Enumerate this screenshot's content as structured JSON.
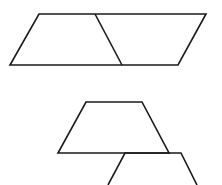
{
  "diagram": {
    "stroke_color": "#1a1a1a",
    "background": "#ffffff",
    "shapes": [
      {
        "name": "parallelogram",
        "points": [
          [
            39,
            14
          ],
          [
            206,
            14
          ],
          [
            178,
            65
          ],
          [
            10,
            65
          ]
        ],
        "closed": true
      },
      {
        "name": "parallelogram-divider",
        "points": [
          [
            95,
            14
          ],
          [
            122,
            65
          ]
        ],
        "closed": false
      },
      {
        "name": "trapezoid",
        "points": [
          [
            86,
            102
          ],
          [
            142,
            102
          ],
          [
            169,
            153
          ],
          [
            58,
            153
          ]
        ],
        "closed": true
      },
      {
        "name": "partial-trapezoid",
        "points": [
          [
            108,
            185
          ],
          [
            125,
            153
          ],
          [
            181,
            153
          ],
          [
            197,
            185
          ]
        ],
        "closed": false
      }
    ]
  }
}
